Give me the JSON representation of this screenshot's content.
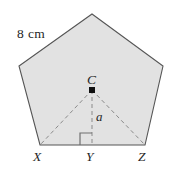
{
  "figure": {
    "shape": "regular-pentagon",
    "fill_color": "#e2e2e2",
    "stroke_color": "#555555",
    "dash_color": "#8a8a8a",
    "text_color": "#262626",
    "background_color": "#ffffff",
    "side_length_label": "8 cm",
    "centre_label": "C",
    "apothem_label": "a",
    "vertex_labels": {
      "left": "X",
      "midpoint": "Y",
      "right": "Z"
    },
    "right_angle_marker": "right-angle"
  },
  "geometry": {
    "pentagon_points": "92,14 163,66 145,145 40,145 19,66",
    "centre": {
      "x": 92,
      "y": 90
    },
    "base_left": {
      "x": 40,
      "y": 145
    },
    "base_mid": {
      "x": 92,
      "y": 145
    },
    "base_right": {
      "x": 145,
      "y": 145
    },
    "right_angle_square": "80,145 80,133 92,133",
    "dash_pattern": "4,3"
  }
}
